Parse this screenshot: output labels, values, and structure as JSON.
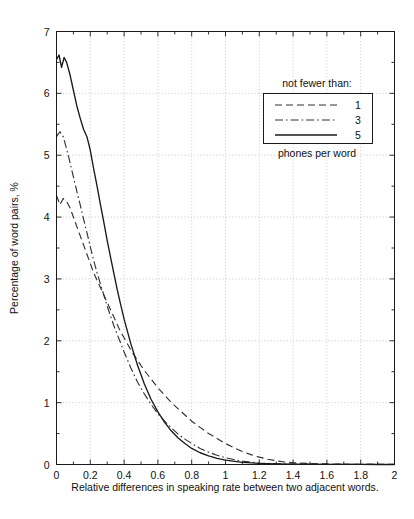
{
  "chart_data": {
    "type": "line",
    "title": "",
    "subtitle": "",
    "xlabel": "Relative differences in speaking rate between two adjacent words.",
    "ylabel": "Percentage of word pairs, %",
    "xlim": [
      0,
      2
    ],
    "ylim": [
      0,
      7
    ],
    "xticks": [
      0,
      0.2,
      0.4,
      0.6,
      0.8,
      1,
      1.2,
      1.4,
      1.6,
      1.8,
      2
    ],
    "xticklabels": [
      "0",
      "0.2",
      "0.4",
      "0.6",
      "0.8",
      "1",
      "1.2",
      "1.4",
      "1.6",
      "1.8",
      "2"
    ],
    "yticks": [
      0,
      1,
      2,
      3,
      4,
      5,
      6,
      7
    ],
    "yticklabels": [
      "0",
      "1",
      "2",
      "3",
      "4",
      "5",
      "6",
      "7"
    ],
    "grid": true,
    "grid_style": "dotted",
    "minor_ticks": true,
    "legend_position": "top-right",
    "legend_title": "not fewer than:",
    "legend_footer": "phones per word",
    "series": [
      {
        "name": "1",
        "label": "1",
        "style": "dashed",
        "color": "#333333",
        "x": [
          0,
          0.02,
          0.04,
          0.06,
          0.08,
          0.1,
          0.12,
          0.14,
          0.16,
          0.18,
          0.2,
          0.22,
          0.24,
          0.26,
          0.28,
          0.3,
          0.32,
          0.34,
          0.36,
          0.38,
          0.4,
          0.44,
          0.48,
          0.52,
          0.56,
          0.6,
          0.64,
          0.68,
          0.72,
          0.76,
          0.8,
          0.85,
          0.9,
          0.95,
          1.0,
          1.05,
          1.1,
          1.15,
          1.2,
          1.25,
          1.3,
          1.35,
          1.4,
          1.5,
          1.6,
          1.7,
          1.8,
          1.9,
          2.0
        ],
        "y": [
          4.35,
          4.2,
          4.3,
          4.25,
          4.15,
          4.0,
          3.85,
          3.7,
          3.55,
          3.4,
          3.25,
          3.1,
          2.98,
          2.86,
          2.74,
          2.62,
          2.5,
          2.38,
          2.26,
          2.14,
          2.05,
          1.85,
          1.68,
          1.52,
          1.38,
          1.24,
          1.12,
          1.0,
          0.9,
          0.8,
          0.7,
          0.6,
          0.5,
          0.42,
          0.34,
          0.27,
          0.21,
          0.16,
          0.12,
          0.085,
          0.06,
          0.04,
          0.028,
          0.015,
          0.009,
          0.005,
          0.003,
          0.002,
          0.001
        ]
      },
      {
        "name": "3",
        "label": "3",
        "style": "dashdot",
        "color": "#333333",
        "x": [
          0,
          0.02,
          0.04,
          0.06,
          0.08,
          0.1,
          0.12,
          0.14,
          0.16,
          0.18,
          0.2,
          0.22,
          0.24,
          0.26,
          0.28,
          0.3,
          0.32,
          0.34,
          0.36,
          0.38,
          0.4,
          0.44,
          0.48,
          0.52,
          0.56,
          0.6,
          0.64,
          0.68,
          0.72,
          0.76,
          0.8,
          0.85,
          0.9,
          0.95,
          1.0,
          1.05,
          1.1,
          1.15,
          1.2,
          1.3,
          1.4,
          1.5,
          1.6,
          1.7,
          1.8,
          1.9,
          2.0
        ],
        "y": [
          5.3,
          5.38,
          5.3,
          5.1,
          4.88,
          4.65,
          4.42,
          4.2,
          3.97,
          3.75,
          3.52,
          3.3,
          3.1,
          2.92,
          2.74,
          2.56,
          2.4,
          2.24,
          2.1,
          1.96,
          1.82,
          1.56,
          1.33,
          1.14,
          0.97,
          0.82,
          0.7,
          0.59,
          0.49,
          0.41,
          0.34,
          0.26,
          0.2,
          0.15,
          0.11,
          0.08,
          0.055,
          0.038,
          0.025,
          0.012,
          0.006,
          0.004,
          0.002,
          0.001,
          0.001,
          0.001,
          0.0
        ]
      },
      {
        "name": "5",
        "label": "5",
        "style": "solid",
        "color": "#1a1a1a",
        "x": [
          0,
          0.015,
          0.03,
          0.045,
          0.06,
          0.08,
          0.1,
          0.12,
          0.14,
          0.16,
          0.18,
          0.2,
          0.22,
          0.24,
          0.26,
          0.28,
          0.3,
          0.32,
          0.34,
          0.36,
          0.38,
          0.4,
          0.44,
          0.48,
          0.52,
          0.56,
          0.6,
          0.64,
          0.68,
          0.72,
          0.76,
          0.8,
          0.85,
          0.9,
          0.95,
          1.0,
          1.1,
          1.2,
          1.3,
          1.4,
          1.5,
          1.6,
          1.7,
          1.8,
          1.9,
          2.0
        ],
        "y": [
          6.55,
          6.62,
          6.42,
          6.58,
          6.5,
          6.3,
          6.05,
          5.8,
          5.6,
          5.42,
          5.3,
          5.08,
          4.78,
          4.5,
          4.2,
          3.92,
          3.62,
          3.35,
          3.08,
          2.82,
          2.58,
          2.35,
          1.95,
          1.6,
          1.3,
          1.05,
          0.85,
          0.68,
          0.54,
          0.43,
          0.34,
          0.26,
          0.19,
          0.14,
          0.1,
          0.07,
          0.035,
          0.018,
          0.01,
          0.006,
          0.004,
          0.002,
          0.001,
          0.001,
          0.0,
          0.0
        ]
      }
    ]
  },
  "axes": {
    "xlabel": "Relative differences in speaking rate between two adjacent words.",
    "ylabel": "Percentage of word pairs, %"
  },
  "legend": {
    "title": "not fewer than:",
    "footer": "phones per word",
    "entries": [
      {
        "label": "1",
        "style": "dashed"
      },
      {
        "label": "3",
        "style": "dashdot"
      },
      {
        "label": "5",
        "style": "solid"
      }
    ]
  },
  "colors": {
    "axis": "#1a1a1a",
    "grid": "#bbbbbb",
    "curve_solid": "#1a1a1a",
    "curve_dashed": "#333333",
    "background": "#ffffff"
  }
}
